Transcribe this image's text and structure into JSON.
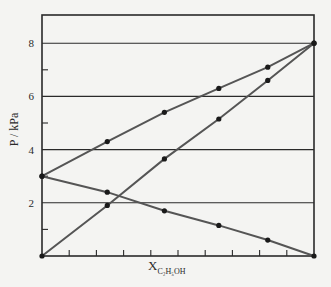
{
  "chart_data": {
    "type": "line",
    "title": "",
    "xlabel": "X_C2H5OH",
    "ylabel": "P / kPa",
    "xlim": [
      0,
      1
    ],
    "ylim": [
      0,
      9
    ],
    "yticks_labeled": [
      2,
      4,
      6,
      8
    ],
    "yticks_minor": [
      1,
      3,
      5,
      7
    ],
    "xticks_count": 10,
    "grid": "horizontal at 2,4,6,8",
    "legend": null,
    "series": [
      {
        "name": "total pressure",
        "x": [
          0,
          0.24,
          0.45,
          0.65,
          0.83,
          1.0
        ],
        "y": [
          3.0,
          4.3,
          5.4,
          6.3,
          7.1,
          8.0
        ]
      },
      {
        "name": "ethanol partial pressure",
        "x": [
          0,
          0.24,
          0.45,
          0.65,
          0.83,
          1.0
        ],
        "y": [
          0,
          1.9,
          3.65,
          5.15,
          6.6,
          8.0
        ]
      },
      {
        "name": "other component partial pressure",
        "x": [
          0,
          0.24,
          0.45,
          0.65,
          0.83,
          1.0
        ],
        "y": [
          3.0,
          2.4,
          1.7,
          1.15,
          0.6,
          0
        ]
      }
    ]
  },
  "labels": {
    "ylabel": "P / kPa",
    "xlabel_main": "X",
    "xlabel_sub": "C₂H₅OH",
    "yticks": [
      "2",
      "4",
      "6",
      "8"
    ]
  },
  "colors": {
    "axis": "#2a2a2a",
    "line": "#555555",
    "marker": "#1a1a1a",
    "background": "#f4f4f2"
  }
}
